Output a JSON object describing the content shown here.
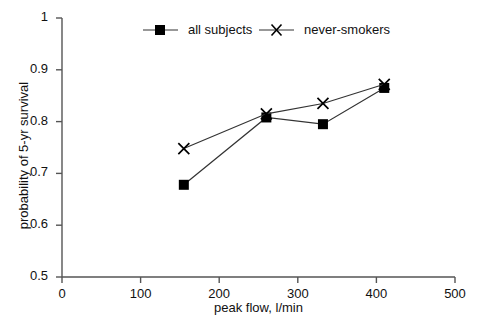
{
  "chart_data": {
    "type": "line",
    "title": "",
    "xlabel": "peak flow, l/min",
    "ylabel": "probability of 5-yr survival",
    "xlim": [
      0,
      500
    ],
    "ylim": [
      0.5,
      1
    ],
    "xticks": [
      "0",
      "100",
      "200",
      "300",
      "400",
      "500"
    ],
    "xtick_values": [
      0,
      100,
      200,
      300,
      400,
      500
    ],
    "yticks": [
      "0.5",
      "0.6",
      "0.7",
      "0.8",
      "0.9",
      "1"
    ],
    "ytick_values": [
      0.5,
      0.6,
      0.7,
      0.8,
      0.9,
      1
    ],
    "grid": false,
    "legend_position": "top-inside",
    "series": [
      {
        "name": "all subjects",
        "marker": "filled-square",
        "color": "#000000",
        "x": [
          155,
          260,
          332,
          410
        ],
        "values": [
          0.678,
          0.808,
          0.795,
          0.865
        ]
      },
      {
        "name": "never-smokers",
        "marker": "x-cross",
        "color": "#000000",
        "x": [
          155,
          260,
          332,
          410
        ],
        "values": [
          0.748,
          0.815,
          0.835,
          0.872
        ]
      }
    ]
  },
  "legend": {
    "entries": [
      {
        "label": "all subjects",
        "marker": "filled-square"
      },
      {
        "label": "never-smokers",
        "marker": "x-cross"
      }
    ]
  },
  "colors": {
    "axis": "#555555",
    "line": "#333333",
    "marker": "#000000",
    "text": "#111111",
    "background": "#ffffff"
  }
}
